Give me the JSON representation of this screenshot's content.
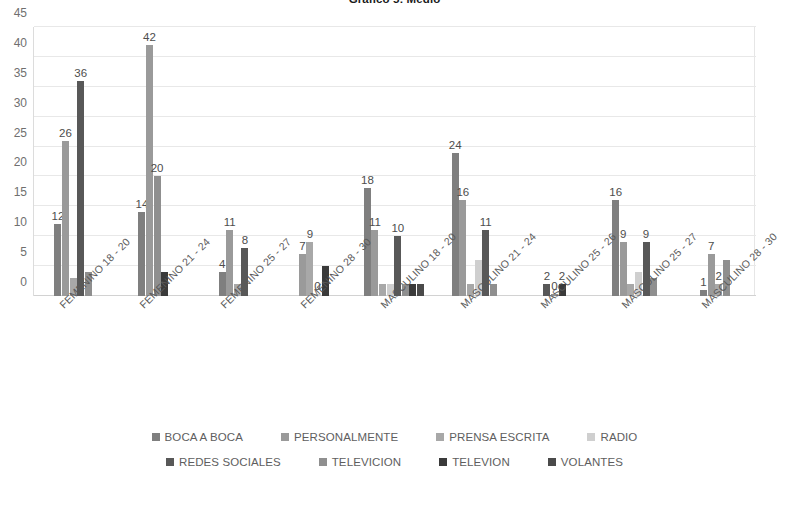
{
  "chart_data": {
    "type": "bar",
    "title": "Gráfico 5: Medio",
    "xlabel": "",
    "ylabel": "",
    "ylim": [
      0,
      45
    ],
    "ytick_step": 5,
    "yticks": [
      0,
      5,
      10,
      15,
      20,
      25,
      30,
      35,
      40,
      45
    ],
    "grid": true,
    "legend_position": "bottom",
    "categories": [
      "FEMENINO 18 - 20",
      "FEMENINO 21 - 24",
      "FEMENINO 25 - 27",
      "FEMENINO 28 - 30",
      "MASCULINO 18 - 20",
      "MASCULINO 21 - 24",
      "MASCULINO 25 - 26",
      "MASCULINO 25 - 27",
      "MASCULINO 28 - 30"
    ],
    "series": [
      {
        "name": "BOCA A BOCA",
        "color": "#7f7f7f",
        "values": [
          12,
          14,
          4,
          null,
          18,
          24,
          null,
          16,
          1
        ]
      },
      {
        "name": "PERSONALMENTE",
        "color": "#9a9a9a",
        "values": [
          26,
          42,
          11,
          7,
          11,
          16,
          null,
          9,
          7
        ]
      },
      {
        "name": "PRENSA ESCRITA",
        "color": "#a8a8a8",
        "values": [
          3,
          null,
          2,
          9,
          2,
          2,
          null,
          2,
          2
        ]
      },
      {
        "name": "RADIO",
        "color": "#cfcfcf",
        "values": [
          null,
          null,
          null,
          0,
          2,
          6,
          null,
          4,
          null
        ]
      },
      {
        "name": "REDES SOCIALES",
        "color": "#585858",
        "values": [
          36,
          null,
          8,
          null,
          10,
          11,
          2,
          9,
          null
        ]
      },
      {
        "name": "TELEVICION",
        "color": "#8f8f8f",
        "values": [
          4,
          20,
          null,
          null,
          2,
          2,
          0,
          3,
          6
        ]
      },
      {
        "name": "TELEVION",
        "color": "#3a3a3a",
        "values": [
          null,
          4,
          null,
          5,
          2,
          null,
          2,
          null,
          null
        ]
      },
      {
        "name": "VOLANTES",
        "color": "#4a4a4a",
        "values": [
          null,
          null,
          null,
          null,
          2,
          null,
          null,
          null,
          null
        ]
      }
    ],
    "data_labels": [
      {
        "group": 0,
        "series": "BOCA A BOCA",
        "text": "12"
      },
      {
        "group": 0,
        "series": "PERSONALMENTE",
        "text": "26"
      },
      {
        "group": 0,
        "series": "REDES SOCIALES",
        "text": "36"
      },
      {
        "group": 1,
        "series": "BOCA A BOCA",
        "text": "14"
      },
      {
        "group": 1,
        "series": "PERSONALMENTE",
        "text": "42"
      },
      {
        "group": 1,
        "series": "TELEVICION",
        "text": "20"
      },
      {
        "group": 2,
        "series": "BOCA A BOCA",
        "text": "4"
      },
      {
        "group": 2,
        "series": "PERSONALMENTE",
        "text": "11"
      },
      {
        "group": 2,
        "series": "REDES SOCIALES",
        "text": "8"
      },
      {
        "group": 3,
        "series": "PERSONALMENTE",
        "text": "7"
      },
      {
        "group": 3,
        "series": "PRENSA ESCRITA",
        "text": "9"
      },
      {
        "group": 3,
        "series": "RADIO",
        "text": "0"
      },
      {
        "group": 4,
        "series": "BOCA A BOCA",
        "text": "18"
      },
      {
        "group": 4,
        "series": "PERSONALMENTE",
        "text": "11"
      },
      {
        "group": 4,
        "series": "REDES SOCIALES",
        "text": "10"
      },
      {
        "group": 5,
        "series": "BOCA A BOCA",
        "text": "24"
      },
      {
        "group": 5,
        "series": "PERSONALMENTE",
        "text": "16"
      },
      {
        "group": 5,
        "series": "REDES SOCIALES",
        "text": "11"
      },
      {
        "group": 6,
        "series": "REDES SOCIALES",
        "text": "2"
      },
      {
        "group": 6,
        "series": "TELEVICION",
        "text": "0"
      },
      {
        "group": 6,
        "series": "TELEVION",
        "text": "2"
      },
      {
        "group": 7,
        "series": "BOCA A BOCA",
        "text": "16"
      },
      {
        "group": 7,
        "series": "PERSONALMENTE",
        "text": "9"
      },
      {
        "group": 7,
        "series": "REDES SOCIALES",
        "text": "9"
      },
      {
        "group": 8,
        "series": "BOCA A BOCA",
        "text": "1"
      },
      {
        "group": 8,
        "series": "PERSONALMENTE",
        "text": "7"
      },
      {
        "group": 8,
        "series": "PRENSA ESCRITA",
        "text": "2"
      }
    ]
  },
  "legend": {
    "rows": [
      [
        {
          "label": "BOCA A BOCA",
          "color": "#7f7f7f"
        },
        {
          "label": "PERSONALMENTE",
          "color": "#9a9a9a"
        },
        {
          "label": "PRENSA ESCRITA",
          "color": "#a8a8a8"
        },
        {
          "label": "RADIO",
          "color": "#cfcfcf"
        }
      ],
      [
        {
          "label": "REDES SOCIALES",
          "color": "#585858"
        },
        {
          "label": "TELEVICION",
          "color": "#8f8f8f"
        },
        {
          "label": "TELEVION",
          "color": "#3a3a3a"
        },
        {
          "label": "VOLANTES",
          "color": "#4a4a4a"
        }
      ]
    ]
  }
}
